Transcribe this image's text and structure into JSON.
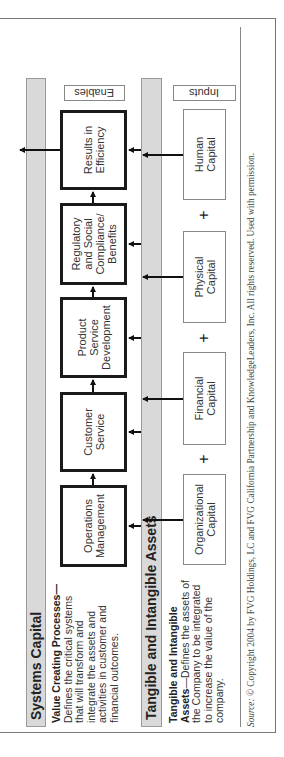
{
  "systems_capital": {
    "title": "Systems Capital",
    "desc_bold": "Value Creating Processes—",
    "desc_lines": [
      "Defines the critical systems",
      "that will transform and",
      "integrate the assets and",
      "activities in customer and",
      "financial outcomes."
    ]
  },
  "assets": {
    "title": "Tangible and Intangible Assets",
    "desc_bold_1": "Tangible and Intangible",
    "desc_bold_2": "Assets",
    "desc_rest_1": "—Defines the assets of",
    "desc_lines": [
      "the Company to be integrated",
      "to increase the value of the",
      "company."
    ]
  },
  "enables_label": "Enables",
  "inputs_label": "Inputs",
  "processes": [
    {
      "l1": "Operations",
      "l2": "Management",
      "l3": "",
      "l4": ""
    },
    {
      "l1": "Customer",
      "l2": "Service",
      "l3": "",
      "l4": ""
    },
    {
      "l1": "Product",
      "l2": "Service",
      "l3": "Development",
      "l4": ""
    },
    {
      "l1": "Regulatory",
      "l2": "and Social",
      "l3": "Compliance/",
      "l4": "Benefits"
    },
    {
      "l1": "Results in",
      "l2": "Efficiency",
      "l3": "",
      "l4": ""
    }
  ],
  "capitals": [
    {
      "l1": "Organizational",
      "l2": "Capital"
    },
    {
      "l1": "Financial",
      "l2": "Capital"
    },
    {
      "l1": "Physical",
      "l2": "Capital"
    },
    {
      "l1": "Human",
      "l2": "Capital"
    }
  ],
  "plus_sign": "+",
  "source": {
    "label": "Source:",
    "text": " © Copyright 2004 by FVG Holdings, LC and FVG California Partnership and KnowledgeLeaders, Inc. All rights reserved. Used with permission."
  }
}
